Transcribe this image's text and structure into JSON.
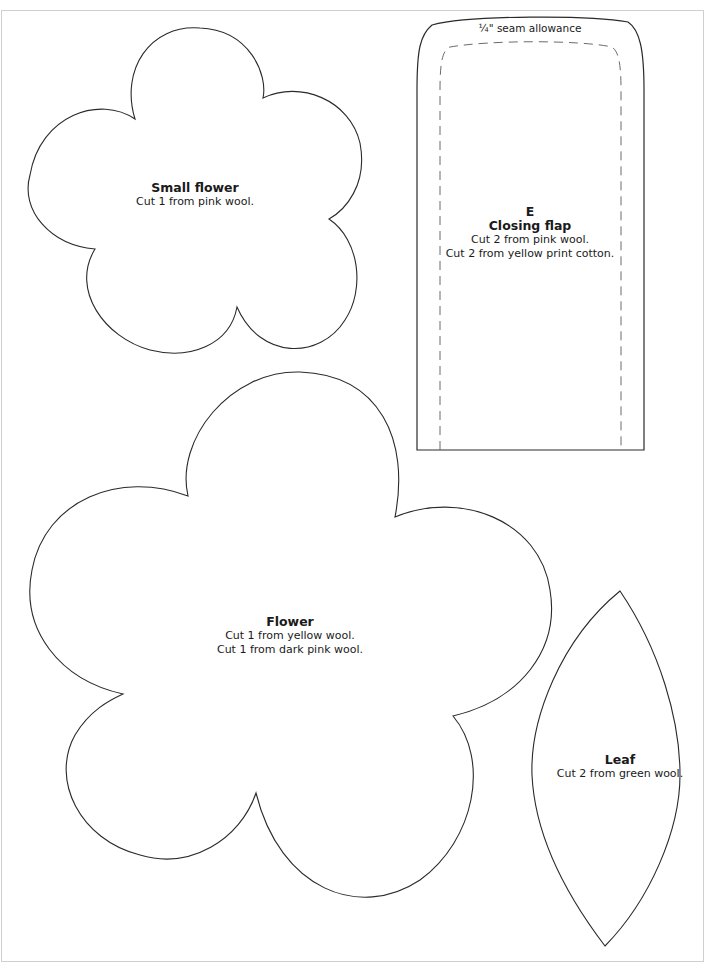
{
  "colors": {
    "outline": "#2a2a2a",
    "dashed": "#6b6b6b",
    "frame": "#cfcfcf",
    "text": "#1a1a1a",
    "background": "#ffffff"
  },
  "pieces": {
    "small_flower": {
      "title": "Small flower",
      "lines": [
        "Cut 1 from pink wool."
      ]
    },
    "closing_flap": {
      "piece_letter": "E",
      "title": "Closing flap",
      "seam_note": "¼\" seam allowance",
      "lines": [
        "Cut 2 from pink wool.",
        "Cut 2 from yellow print cotton."
      ]
    },
    "flower": {
      "title": "Flower",
      "lines": [
        "Cut 1 from yellow wool.",
        "Cut 1 from dark pink wool."
      ]
    },
    "leaf": {
      "title": "Leaf",
      "lines": [
        "Cut 2 from green wool."
      ]
    }
  }
}
